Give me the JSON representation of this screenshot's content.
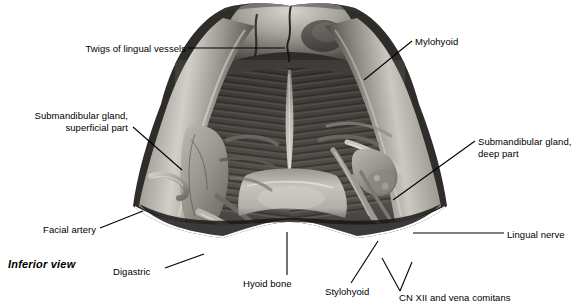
{
  "figure": {
    "type": "anatomical-photograph",
    "caption": "Inferior view",
    "palette": {
      "background": "#ffffff",
      "ink": "#000000",
      "bone_light": "#c9c6c0",
      "bone_mid": "#8d8a85",
      "muscle_dark": "#3a3835",
      "muscle_mid": "#57544f",
      "gland_light": "#a9a6a0",
      "shadow": "#1c1b19"
    }
  },
  "labels": [
    {
      "id": "twigs-of-lingual-vessels",
      "text": "Twigs of lingual vessels",
      "align": "right",
      "left": 60,
      "top": 43,
      "width": 126
    },
    {
      "id": "submandibular-gland-superficial-part",
      "text": "Submandibular gland,\nsuperficial part",
      "align": "right",
      "left": 10,
      "top": 110,
      "width": 118
    },
    {
      "id": "facial-artery",
      "text": "Facial artery",
      "align": "right",
      "left": 32,
      "top": 224,
      "width": 64
    },
    {
      "id": "digastric",
      "text": "Digastric",
      "align": "left",
      "left": 113,
      "top": 266,
      "width": 50
    },
    {
      "id": "hyoid-bone",
      "text": "Hyoid bone",
      "align": "center",
      "left": 243,
      "top": 278,
      "width": 62
    },
    {
      "id": "stylohyoid",
      "text": "Stylohyoid",
      "align": "center",
      "left": 325,
      "top": 286,
      "width": 56
    },
    {
      "id": "cn-xii-and-vena-comitans",
      "text": "CN XII and vena comitans",
      "align": "left",
      "left": 399,
      "top": 292,
      "width": 136
    },
    {
      "id": "lingual-nerve",
      "text": "Lingual nerve",
      "align": "left",
      "left": 507,
      "top": 229,
      "width": 70
    },
    {
      "id": "submandibular-gland-deep-part",
      "text": "Submandibular gland,\ndeep part",
      "align": "left",
      "left": 478,
      "top": 136,
      "width": 100
    },
    {
      "id": "mylohyoid",
      "text": "Mylohyoid",
      "align": "left",
      "left": 415,
      "top": 36,
      "width": 56
    }
  ],
  "leaders": [
    {
      "id": "leader-twigs-of-lingual-vessels",
      "points": "188,48 285,48"
    },
    {
      "id": "leader-submandibular-gland-superficial-part",
      "points": "133,127 182,170"
    },
    {
      "id": "leader-facial-artery",
      "points": "100,228 143,211"
    },
    {
      "id": "leader-digastric",
      "points": "165,268 204,254"
    },
    {
      "id": "leader-hyoid-bone",
      "points": "287,275 287,232"
    },
    {
      "id": "leader-stylohyoid",
      "points": "351,283 378,241"
    },
    {
      "id": "leader-cn-xii-1",
      "points": "400,291 382,258"
    },
    {
      "id": "leader-cn-xii-2",
      "points": "400,291 412,262"
    },
    {
      "id": "leader-lingual-nerve",
      "points": "504,233 413,233"
    },
    {
      "id": "leader-submandibular-gland-deep-part",
      "points": "475,141 393,200"
    },
    {
      "id": "leader-mylohyoid",
      "points": "412,41 364,80"
    }
  ]
}
